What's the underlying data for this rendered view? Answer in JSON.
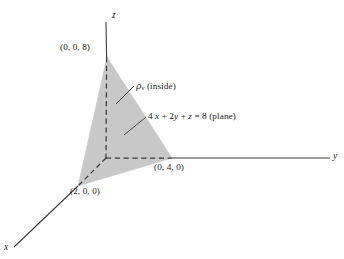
{
  "figure": {
    "kind": "3d-coordinate-diagram",
    "background_color": "#ffffff",
    "line_color": "#3a3a3a",
    "shade_color": "#c8c8c8",
    "axes": {
      "z_label": "z",
      "y_label": "y",
      "x_label": "x"
    },
    "points": [
      {
        "id": "z-intercept",
        "label": "(0, 0, 8)"
      },
      {
        "id": "x-intercept",
        "label": "(2, 0, 0)"
      },
      {
        "id": "y-intercept",
        "label": "(0, 4, 0)"
      }
    ],
    "annotations": [
      {
        "id": "region-label",
        "symbol": "ρ",
        "subscript": "v",
        "text": " (inside)",
        "full": "ρᵥ (inside)"
      },
      {
        "id": "plane-label",
        "full": "4 x + 2y + z = 8 (plane)",
        "parts": {
          "coef_a": "4 ",
          "var_x": "x",
          "plus_1": " + ",
          "coef_b": "2",
          "var_y": "y",
          "plus_2": " + ",
          "var_z": "z",
          "equals": " = ",
          "rhs": "8",
          "kind": " (plane)"
        }
      }
    ]
  }
}
